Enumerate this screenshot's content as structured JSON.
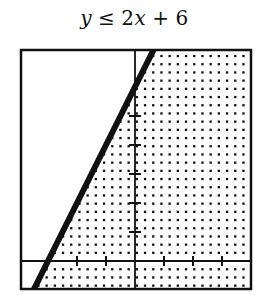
{
  "title": {
    "lhs_var": "y",
    "operator": "≤",
    "coef": "2",
    "rhs_var": "x",
    "plus": "+",
    "constant": "6"
  },
  "chart_data": {
    "type": "inequality-graph",
    "inequality": "y <= 2x + 6",
    "boundary_line": {
      "slope": 2,
      "intercept": 6,
      "style": "solid",
      "x_intercept": -3,
      "y_intercept": 6
    },
    "shaded_region": "below-right of line (y ≤ 2x + 6)",
    "shading_style": "dot-pattern",
    "xlim": [
      -3.9,
      4.0
    ],
    "ylim": [
      -0.97,
      7.28
    ],
    "x_ticks": [
      -2,
      -1,
      1,
      2,
      3
    ],
    "y_ticks": [
      1,
      2,
      3,
      4,
      5
    ],
    "tick_labels": false,
    "grid": false
  },
  "layout": {
    "box": {
      "left": 21,
      "top": 50,
      "right": 251,
      "bottom": 289
    },
    "origin_px": {
      "x": 135,
      "y": 261
    },
    "unit_px": 29,
    "dot_pitch_px": 8.2,
    "colors": {
      "ink": "#111111",
      "background": "#ffffff"
    }
  }
}
